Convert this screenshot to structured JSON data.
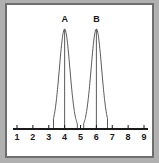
{
  "figure": {
    "title": "",
    "frame_color": "#6e6e6e",
    "background_color": "#b0b0b0",
    "plot_background": "#ffffff",
    "curve_color": "#5a5a5a",
    "axis_color": "#1a1a1a"
  },
  "chart_data": {
    "type": "line",
    "title": "",
    "xlabel": "",
    "ylabel": "",
    "xlim": [
      1,
      9
    ],
    "ylim": [
      0,
      1
    ],
    "grid": false,
    "legend": "none",
    "x_ticks": [
      1,
      2,
      3,
      4,
      5,
      6,
      7,
      8,
      9
    ],
    "x_tick_labels": [
      "1",
      "2",
      "3",
      "4",
      "5",
      "6",
      "7",
      "8",
      "9"
    ],
    "y_axis_visible": false,
    "annotations": [
      {
        "text": "A",
        "x": 4,
        "y": 1.08
      },
      {
        "text": "B",
        "x": 6,
        "y": 1.08
      }
    ],
    "series": [
      {
        "name": "A",
        "label": "A",
        "kind": "normal-distribution-curve",
        "mean": 4,
        "sigma": 0.33,
        "peak_height": 1.0,
        "x_start": 3.3,
        "x_end": 4.8,
        "center_line": 4,
        "edge_lines": [
          3.3,
          4.8
        ]
      },
      {
        "name": "B",
        "label": "B",
        "kind": "normal-distribution-curve",
        "mean": 6,
        "sigma": 0.33,
        "peak_height": 1.0,
        "x_start": 5.2,
        "x_end": 6.7,
        "center_line": 6,
        "edge_lines": [
          5.2,
          6.7
        ]
      }
    ]
  }
}
